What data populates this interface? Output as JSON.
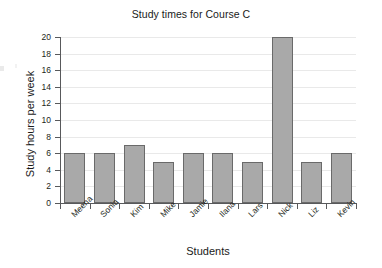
{
  "chart_data": {
    "type": "bar",
    "title": "Study times for Course C",
    "xlabel": "Students",
    "ylabel": "Study hours per week",
    "categories": [
      "Meena",
      "Sonia",
      "Kim",
      "Mike",
      "Jamie",
      "Ilana",
      "Lars",
      "Nick",
      "Liz",
      "Kevin"
    ],
    "values": [
      6,
      6,
      7,
      5,
      6,
      6,
      5,
      20,
      5,
      6
    ],
    "ylim": [
      0,
      20
    ],
    "yticks": [
      0,
      2,
      4,
      6,
      8,
      10,
      12,
      14,
      16,
      18,
      20
    ],
    "ytick_labels": [
      "0",
      "2",
      "4",
      "6",
      "8",
      "10",
      "12",
      "14",
      "16",
      "18",
      "20"
    ],
    "grid": true,
    "legend": false,
    "bar_color": "#a9a9a9",
    "bar_border_color": "#6a6a6a",
    "axis_color": "#58595b",
    "gridline_color": "#e9e9e9",
    "text_color": "#231f20"
  }
}
